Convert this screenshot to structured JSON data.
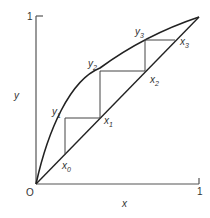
{
  "diagram": {
    "axes": {
      "x_label": "x",
      "y_label": "y",
      "origin_label": "O",
      "x_max_label": "1",
      "y_max_label": "1"
    },
    "points": {
      "x0": {
        "base": "x",
        "sub": "0"
      },
      "x1": {
        "base": "x",
        "sub": "1"
      },
      "x2": {
        "base": "x",
        "sub": "2"
      },
      "x3": {
        "base": "x",
        "sub": "3"
      },
      "y1": {
        "base": "y",
        "sub": "1"
      },
      "y2": {
        "base": "y",
        "sub": "2"
      },
      "y3": {
        "base": "y",
        "sub": "3"
      }
    },
    "colors": {
      "curve": "#222222",
      "axis": "#555555",
      "step": "#444444"
    }
  }
}
